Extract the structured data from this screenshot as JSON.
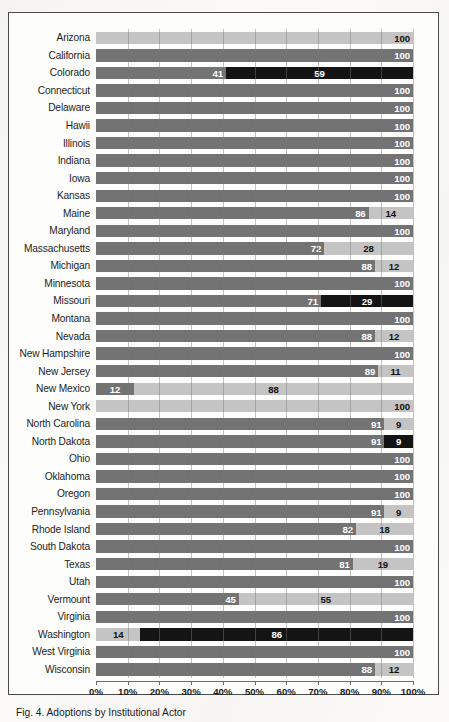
{
  "figure": {
    "caption": "Fig. 4. Adoptions by Institutional Actor"
  },
  "colors": {
    "legislative": "#737373",
    "regulatory": "#c4c4c4",
    "initiative": "#141414",
    "frame": "#4a4a4a",
    "gridline": "#787878"
  },
  "legend": {
    "items": [
      {
        "name": "legislative",
        "label": "Legislative\nPercentage",
        "color": "#737373"
      },
      {
        "name": "regulatory",
        "label": "Regulatory\nPercentage",
        "color": "#c4c4c4"
      },
      {
        "name": "initiative",
        "label": "Initiative\nPercentage",
        "color": "#141414"
      }
    ]
  },
  "axis": {
    "ticks": [
      0,
      10,
      20,
      30,
      40,
      50,
      60,
      70,
      80,
      90,
      100
    ],
    "ticklabels": [
      "0%",
      "10%",
      "20%",
      "30%",
      "40%",
      "50%",
      "60%",
      "70%",
      "80%",
      "90%",
      "100%"
    ]
  },
  "chart_data": {
    "type": "bar",
    "orientation": "horizontal",
    "stacked": true,
    "title": "Fig. 4. Adoptions by Institutional Actor",
    "xlabel": "",
    "ylabel": "",
    "xlim": [
      0,
      100
    ],
    "grid": true,
    "legend_position": "bottom",
    "series": [
      {
        "name": "Legislative Percentage",
        "color": "#737373"
      },
      {
        "name": "Regulatory Percentage",
        "color": "#c4c4c4"
      },
      {
        "name": "Initiative Percentage",
        "color": "#141414"
      }
    ],
    "categories": [
      "Arizona",
      "California",
      "Colorado",
      "Connecticut",
      "Delaware",
      "Hawii",
      "Illinois",
      "Indiana",
      "Iowa",
      "Kansas",
      "Maine",
      "Maryland",
      "Massachusetts",
      "Michigan",
      "Minnesota",
      "Missouri",
      "Montana",
      "Nevada",
      "New Hampshire",
      "New Jersey",
      "New Mexico",
      "New York",
      "North Carolina",
      "North Dakota",
      "Ohio",
      "Oklahoma",
      "Oregon",
      "Pennsylvania",
      "Rhode Island",
      "South Dakota",
      "Texas",
      "Utah",
      "Vermount",
      "Virginia",
      "Washington",
      "West Virginia",
      "Wisconsin"
    ],
    "rows": [
      {
        "state": "Arizona",
        "segments": [
          {
            "type": "regulatory",
            "value": 100,
            "label": "100"
          }
        ]
      },
      {
        "state": "California",
        "segments": [
          {
            "type": "legislative",
            "value": 100,
            "label": "100"
          }
        ]
      },
      {
        "state": "Colorado",
        "segments": [
          {
            "type": "legislative",
            "value": 41,
            "label": "41"
          },
          {
            "type": "initiative",
            "value": 59,
            "label": "59",
            "center": true
          }
        ]
      },
      {
        "state": "Connecticut",
        "segments": [
          {
            "type": "legislative",
            "value": 100,
            "label": "100"
          }
        ]
      },
      {
        "state": "Delaware",
        "segments": [
          {
            "type": "legislative",
            "value": 100,
            "label": "100"
          }
        ]
      },
      {
        "state": "Hawii",
        "segments": [
          {
            "type": "legislative",
            "value": 100,
            "label": "100"
          }
        ]
      },
      {
        "state": "Illinois",
        "segments": [
          {
            "type": "legislative",
            "value": 100,
            "label": "100"
          }
        ]
      },
      {
        "state": "Indiana",
        "segments": [
          {
            "type": "legislative",
            "value": 100,
            "label": "100"
          }
        ]
      },
      {
        "state": "Iowa",
        "segments": [
          {
            "type": "legislative",
            "value": 100,
            "label": "100"
          }
        ]
      },
      {
        "state": "Kansas",
        "segments": [
          {
            "type": "legislative",
            "value": 100,
            "label": "100"
          }
        ]
      },
      {
        "state": "Maine",
        "segments": [
          {
            "type": "legislative",
            "value": 86,
            "label": "86"
          },
          {
            "type": "regulatory",
            "value": 14,
            "label": "14",
            "center": true
          }
        ]
      },
      {
        "state": "Maryland",
        "segments": [
          {
            "type": "legislative",
            "value": 100,
            "label": "100"
          }
        ]
      },
      {
        "state": "Massachusetts",
        "segments": [
          {
            "type": "legislative",
            "value": 72,
            "label": "72"
          },
          {
            "type": "regulatory",
            "value": 28,
            "label": "28",
            "center": true
          }
        ]
      },
      {
        "state": "Michigan",
        "segments": [
          {
            "type": "legislative",
            "value": 88,
            "label": "88"
          },
          {
            "type": "regulatory",
            "value": 12,
            "label": "12",
            "center": true
          }
        ]
      },
      {
        "state": "Minnesota",
        "segments": [
          {
            "type": "legislative",
            "value": 100,
            "label": "100"
          }
        ]
      },
      {
        "state": "Missouri",
        "segments": [
          {
            "type": "legislative",
            "value": 71,
            "label": "71"
          },
          {
            "type": "initiative",
            "value": 29,
            "label": "29",
            "center": true
          }
        ]
      },
      {
        "state": "Montana",
        "segments": [
          {
            "type": "legislative",
            "value": 100,
            "label": "100"
          }
        ]
      },
      {
        "state": "Nevada",
        "segments": [
          {
            "type": "legislative",
            "value": 88,
            "label": "88"
          },
          {
            "type": "regulatory",
            "value": 12,
            "label": "12",
            "center": true
          }
        ]
      },
      {
        "state": "New Hampshire",
        "segments": [
          {
            "type": "legislative",
            "value": 100,
            "label": "100"
          }
        ]
      },
      {
        "state": "New Jersey",
        "segments": [
          {
            "type": "legislative",
            "value": 89,
            "label": "89"
          },
          {
            "type": "regulatory",
            "value": 11,
            "label": "11",
            "center": true
          }
        ]
      },
      {
        "state": "New Mexico",
        "segments": [
          {
            "type": "legislative",
            "value": 12,
            "label": "12",
            "center": true
          },
          {
            "type": "regulatory",
            "value": 88,
            "label": "88",
            "center": true
          }
        ]
      },
      {
        "state": "New York",
        "segments": [
          {
            "type": "regulatory",
            "value": 100,
            "label": "100"
          }
        ]
      },
      {
        "state": "North Carolina",
        "segments": [
          {
            "type": "legislative",
            "value": 91,
            "label": "91"
          },
          {
            "type": "regulatory",
            "value": 9,
            "label": "9",
            "center": true
          }
        ]
      },
      {
        "state": "North Dakota",
        "segments": [
          {
            "type": "legislative",
            "value": 91,
            "label": "91"
          },
          {
            "type": "initiative",
            "value": 9,
            "label": "9",
            "center": true
          }
        ]
      },
      {
        "state": "Ohio",
        "segments": [
          {
            "type": "legislative",
            "value": 100,
            "label": "100"
          }
        ]
      },
      {
        "state": "Oklahoma",
        "segments": [
          {
            "type": "legislative",
            "value": 100,
            "label": "100"
          }
        ]
      },
      {
        "state": "Oregon",
        "segments": [
          {
            "type": "legislative",
            "value": 100,
            "label": "100"
          }
        ]
      },
      {
        "state": "Pennsylvania",
        "segments": [
          {
            "type": "legislative",
            "value": 91,
            "label": "91"
          },
          {
            "type": "regulatory",
            "value": 9,
            "label": "9",
            "center": true
          }
        ]
      },
      {
        "state": "Rhode Island",
        "segments": [
          {
            "type": "legislative",
            "value": 82,
            "label": "82"
          },
          {
            "type": "regulatory",
            "value": 18,
            "label": "18",
            "center": true
          }
        ]
      },
      {
        "state": "South Dakota",
        "segments": [
          {
            "type": "legislative",
            "value": 100,
            "label": "100"
          }
        ]
      },
      {
        "state": "Texas",
        "segments": [
          {
            "type": "legislative",
            "value": 81,
            "label": "81"
          },
          {
            "type": "regulatory",
            "value": 19,
            "label": "19",
            "center": true
          }
        ]
      },
      {
        "state": "Utah",
        "segments": [
          {
            "type": "legislative",
            "value": 100,
            "label": "100"
          }
        ]
      },
      {
        "state": "Vermount",
        "segments": [
          {
            "type": "legislative",
            "value": 45,
            "label": "45"
          },
          {
            "type": "regulatory",
            "value": 55,
            "label": "55",
            "center": true
          }
        ]
      },
      {
        "state": "Virginia",
        "segments": [
          {
            "type": "legislative",
            "value": 100,
            "label": "100"
          }
        ]
      },
      {
        "state": "Washington",
        "segments": [
          {
            "type": "regulatory",
            "value": 14,
            "label": "14",
            "center": true
          },
          {
            "type": "initiative",
            "value": 86,
            "label": "86",
            "center": true
          }
        ]
      },
      {
        "state": "West Virginia",
        "segments": [
          {
            "type": "legislative",
            "value": 100,
            "label": "100"
          }
        ]
      },
      {
        "state": "Wisconsin",
        "segments": [
          {
            "type": "legislative",
            "value": 88,
            "label": "88"
          },
          {
            "type": "regulatory",
            "value": 12,
            "label": "12",
            "center": true
          }
        ]
      }
    ]
  }
}
